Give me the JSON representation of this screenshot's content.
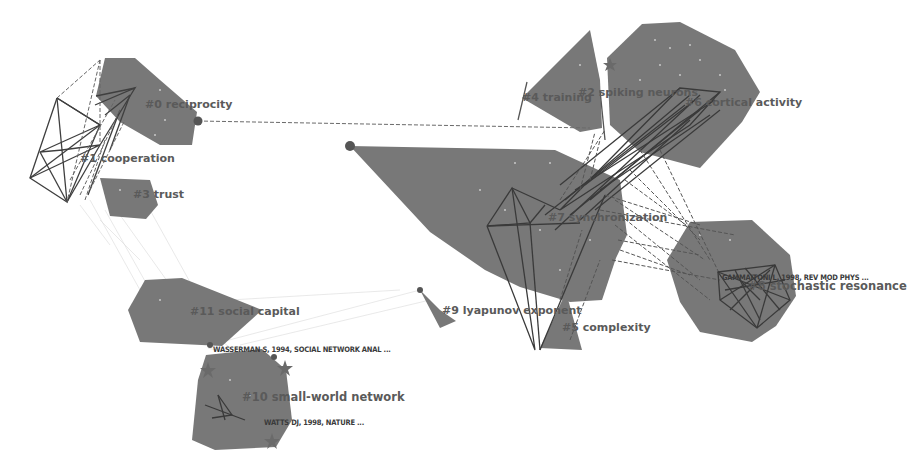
{
  "colors": {
    "background": "#ffffff",
    "hull": "#7a7a7a",
    "hull_dark": "#6f6f6f",
    "edge": "#3f3f3f",
    "edge_dash": "#5a5a5a",
    "edge_faint": "#d6d6d6",
    "node": "#555555",
    "node_dot": "#bdbdbd",
    "label": "#5a5a5a",
    "ref_label": "#3a3a3a"
  },
  "clusters": [
    {
      "id": 0,
      "label": "#0 reciprocity",
      "x": 145,
      "y": 108,
      "polygon": "105,58 135,58 160,80 195,110 190,145 160,145 120,120 95,95"
    },
    {
      "id": 1,
      "label": "#1 cooperation",
      "x": 78,
      "y": 162,
      "polygon": ""
    },
    {
      "id": 2,
      "label": "#3 trust",
      "x": 133,
      "y": 198,
      "polygon": "100,178 150,180 158,205 145,218 110,215"
    },
    {
      "id": 3,
      "label": "#4 training",
      "x": 525,
      "y": 102,
      "polygon": "590,30 600,80 600,128 580,130 522,96"
    },
    {
      "id": 4,
      "label": "#2 spiking neurons",
      "x": 578,
      "y": 96,
      "polygon": "640,22 680,22 735,50 758,90 740,120 700,165 640,150 610,125 608,55"
    },
    {
      "id": 5,
      "label": "#6 cortical activity",
      "x": 685,
      "y": 106,
      "polygon": ""
    },
    {
      "id": 6,
      "label": "#7 synchronization",
      "x": 548,
      "y": 220,
      "polygon": "355,146 560,150 620,180 625,235 615,255 600,300 570,300 520,285 485,268 430,230"
    },
    {
      "id": 7,
      "label": "#8 stochastic resonance",
      "x": 745,
      "y": 290,
      "polygon": "690,222 750,220 790,255 795,295 775,325 750,340 700,330 680,300 668,260"
    },
    {
      "id": 8,
      "label": "#11 social capital",
      "x": 190,
      "y": 314,
      "polygon": "145,280 180,278 260,310 220,345 140,340 128,310"
    },
    {
      "id": 9,
      "label": "#9 lyapunov exponent",
      "x": 443,
      "y": 313,
      "polygon": "420,290 440,310 455,320 440,327"
    },
    {
      "id": 10,
      "label": "#5 complexity",
      "x": 562,
      "y": 330,
      "polygon": "565,295 580,350 540,348"
    },
    {
      "id": 11,
      "label": "#10 small-world network",
      "x": 242,
      "y": 400,
      "polygon": "205,355 260,350 285,370 290,420 275,445 215,448 192,440 198,380"
    }
  ],
  "references": [
    {
      "label": "WASSERMAN S, 1994,  SOCIAL NETWORK ANAL ...",
      "x": 213,
      "y": 350
    },
    {
      "label": "WATTS DJ, 1998,  NATURE ...",
      "x": 264,
      "y": 424
    },
    {
      "label": "GAMMAITONI L, 1998,  REV MOD PHYS ...",
      "x": 720,
      "y": 283
    }
  ],
  "nodes": [
    {
      "x": 198,
      "y": 121,
      "r": 4.5
    },
    {
      "x": 350,
      "y": 146,
      "r": 5
    },
    {
      "x": 420,
      "y": 290,
      "r": 3
    },
    {
      "x": 210,
      "y": 345,
      "r": 3
    },
    {
      "x": 274,
      "y": 357,
      "r": 3
    }
  ],
  "stars": [
    {
      "x": 208,
      "y": 370
    },
    {
      "x": 285,
      "y": 368
    },
    {
      "x": 272,
      "y": 441
    },
    {
      "x": 226,
      "y": 418
    }
  ]
}
